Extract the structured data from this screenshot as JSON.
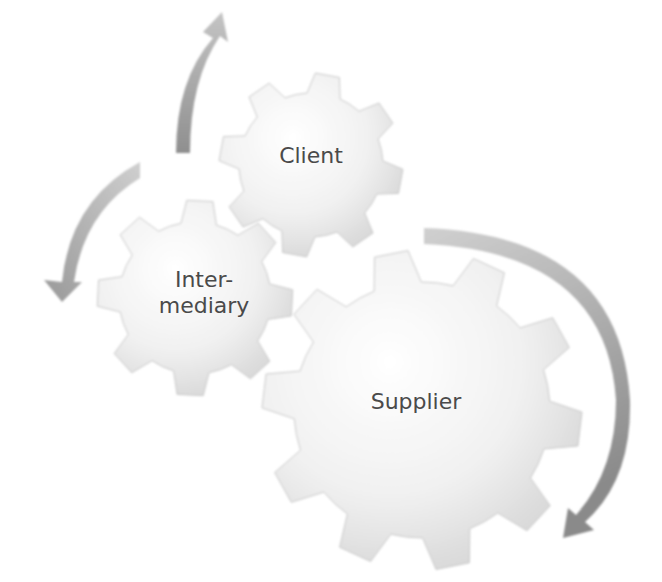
{
  "diagram": {
    "type": "cycle-gears",
    "colors": {
      "gear_fill_light": "#f4f4f4",
      "gear_fill_dark": "#d4d4d4",
      "gear_edge": "#c8c8c8",
      "arrow_light": "#c9c9c9",
      "arrow_dark": "#8f8f8f",
      "label": "#4a4a4a"
    },
    "gears": [
      {
        "id": "client",
        "label": "Client",
        "cx": 311,
        "cy": 165,
        "r_outer": 92,
        "r_inner": 72,
        "teeth": 8,
        "font_size": 22
      },
      {
        "id": "intermediary",
        "label": "Inter-\nmediary",
        "cx": 195,
        "cy": 298,
        "r_outer": 98,
        "r_inner": 76,
        "teeth": 8,
        "font_size": 22
      },
      {
        "id": "supplier",
        "label": "Supplier",
        "cx": 422,
        "cy": 410,
        "r_outer": 160,
        "r_inner": 128,
        "teeth": 10,
        "font_size": 22
      }
    ],
    "arrows": [
      {
        "id": "arrow-intermediary-to-client",
        "direction": "up",
        "from": "intermediary",
        "to": "client"
      },
      {
        "id": "arrow-client-to-intermediary",
        "direction": "down",
        "from": "client",
        "to": "intermediary"
      },
      {
        "id": "arrow-client-to-supplier",
        "direction": "down",
        "from": "client",
        "to": "supplier"
      }
    ]
  }
}
